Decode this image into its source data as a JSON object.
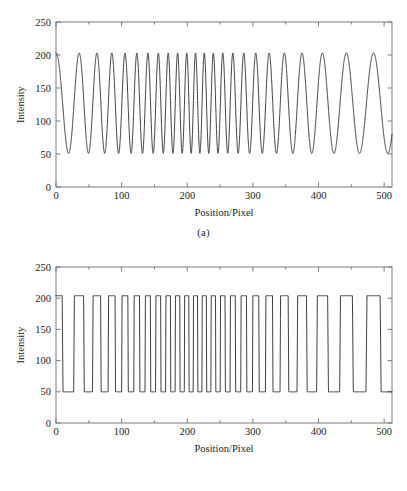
{
  "figure": {
    "background": "#ffffff",
    "line_color": "#1c1c1c",
    "axis_color": "#6d6d6d"
  },
  "panels": [
    {
      "id": "a",
      "caption": "(a)",
      "axis_title_y": "Intensity",
      "axis_title_x": "Position/Pixel"
    },
    {
      "id": "b",
      "caption": "(b)",
      "axis_title_y": "Intensity",
      "axis_title_x": "Position/Pixel"
    }
  ],
  "chart_data": [
    {
      "type": "line",
      "panel": "a",
      "title": "",
      "subtitle": "(a)",
      "xlabel": "Position/Pixel",
      "ylabel": "Intensity",
      "xlim": [
        0,
        512
      ],
      "ylim": [
        0,
        250
      ],
      "xticks": [
        0,
        100,
        200,
        300,
        400,
        500
      ],
      "xticklabels": [
        "0",
        "100",
        "200",
        "300",
        "400",
        "500"
      ],
      "yticks": [
        0,
        50,
        100,
        150,
        200,
        250
      ],
      "yticklabels": [
        "0",
        "50",
        "100",
        "150",
        "200",
        "250"
      ],
      "grid": false,
      "legend": null,
      "waveform": "sinusoidal-chirp",
      "amplitude_min": 51,
      "amplitude_max": 203,
      "mean_level": 127,
      "amplitude": 76,
      "series": [
        {
          "name": "Intensity",
          "description": "Sinusoidal chirp: frequency rises from the left edge to a maximum near Position 215, then falls toward the right edge.",
          "frequency_profile_cycles_per_pixel": [
            {
              "x": 0,
              "f": 0.0235
            },
            {
              "x": 60,
              "f": 0.04
            },
            {
              "x": 120,
              "f": 0.057
            },
            {
              "x": 180,
              "f": 0.07
            },
            {
              "x": 215,
              "f": 0.076
            },
            {
              "x": 250,
              "f": 0.069
            },
            {
              "x": 300,
              "f": 0.053
            },
            {
              "x": 360,
              "f": 0.037
            },
            {
              "x": 420,
              "f": 0.0275
            },
            {
              "x": 470,
              "f": 0.0235
            },
            {
              "x": 512,
              "f": 0.0225
            }
          ]
        }
      ]
    },
    {
      "type": "line",
      "panel": "b",
      "title": "",
      "subtitle": "(b)",
      "xlabel": "Position/Pixel",
      "ylabel": "Intensity",
      "xlim": [
        0,
        512
      ],
      "ylim": [
        0,
        250
      ],
      "xticks": [
        0,
        100,
        200,
        300,
        400,
        500
      ],
      "xticklabels": [
        "0",
        "100",
        "200",
        "300",
        "400",
        "500"
      ],
      "yticks": [
        0,
        50,
        100,
        150,
        200,
        250
      ],
      "yticklabels": [
        "0",
        "50",
        "100",
        "150",
        "200",
        "250"
      ],
      "grid": false,
      "legend": null,
      "waveform": "square-chirp",
      "amplitude_min": 50,
      "amplitude_max": 204,
      "mean_level": 127,
      "amplitude": 77,
      "series": [
        {
          "name": "Intensity",
          "description": "Binarised (square / trapezoidal) version of the chirp in panel (a); same instantaneous frequency, flat tops at 204 and flat bottoms at 50 with steep sloped transitions.",
          "frequency_profile_cycles_per_pixel": [
            {
              "x": 0,
              "f": 0.0235
            },
            {
              "x": 60,
              "f": 0.04
            },
            {
              "x": 120,
              "f": 0.057
            },
            {
              "x": 180,
              "f": 0.07
            },
            {
              "x": 215,
              "f": 0.076
            },
            {
              "x": 250,
              "f": 0.069
            },
            {
              "x": 300,
              "f": 0.053
            },
            {
              "x": 360,
              "f": 0.037
            },
            {
              "x": 420,
              "f": 0.0275
            },
            {
              "x": 470,
              "f": 0.0235
            },
            {
              "x": 512,
              "f": 0.0225
            }
          ]
        }
      ]
    }
  ]
}
